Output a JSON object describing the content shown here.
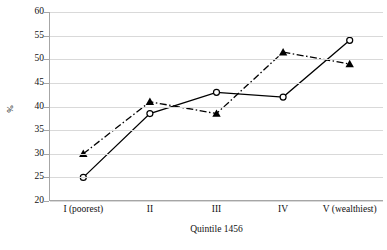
{
  "chart_data": {
    "type": "line",
    "title": "",
    "xlabel": "Quintile 1456",
    "ylabel": "%",
    "categories": [
      "I (poorest)",
      "II",
      "III",
      "IV",
      "V (wealthiest)"
    ],
    "ylim": [
      20,
      60
    ],
    "ytick_labels": [
      "20",
      "25",
      "30",
      "35",
      "40",
      "45",
      "50",
      "55",
      "60"
    ],
    "ytick_values": [
      20,
      25,
      30,
      35,
      40,
      45,
      50,
      55,
      60
    ],
    "grid": true,
    "legend": "none",
    "series": [
      {
        "name": "series-solid-circle",
        "line_style": "solid",
        "marker": "open-circle",
        "color": "#000000",
        "values": [
          25,
          38.5,
          43,
          42,
          54
        ]
      },
      {
        "name": "series-dashdot-triangle",
        "line_style": "dash-dot",
        "marker": "filled-triangle",
        "color": "#000000",
        "values": [
          30,
          41,
          38.5,
          51.5,
          49
        ]
      }
    ],
    "colors": {
      "gridline": "#d9d9d9",
      "axis": "#a6a6a6",
      "text": "#111111",
      "plot_background": "#ffffff"
    }
  }
}
